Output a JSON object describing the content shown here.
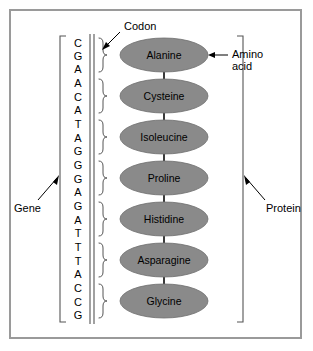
{
  "figure": {
    "background_color": "#ffffff",
    "frame_color": "#9a9a9a"
  },
  "dna": {
    "sequence": [
      "C",
      "G",
      "A",
      "A",
      "C",
      "A",
      "T",
      "A",
      "G",
      "G",
      "G",
      "A",
      "G",
      "A",
      "T",
      "T",
      "T",
      "A",
      "C",
      "C",
      "G"
    ],
    "sequence_string": "CGAACATAGGGAGATTTACCG",
    "base_count": 21,
    "strand_color": "#8a8a8a",
    "bracket_color": "#555555"
  },
  "codons": {
    "count": 7,
    "bases_per_codon": 3,
    "groups": [
      "CGA",
      "ACA",
      "TAG",
      "GGA",
      "GAT",
      "TTA",
      "CCG"
    ],
    "brace_color": "#555555"
  },
  "protein": {
    "amino_acids": [
      {
        "name": "Alanine"
      },
      {
        "name": "Cysteine"
      },
      {
        "name": "Isoleucine"
      },
      {
        "name": "Proline"
      },
      {
        "name": "Histidine"
      },
      {
        "name": "Asparagine"
      },
      {
        "name": "Glycine"
      }
    ],
    "ellipse_fill": "#8a8a8a",
    "ellipse_stroke": "#6e6e6e",
    "bond_color": "#3a3a3a",
    "label_color": "#000000"
  },
  "labels": {
    "codon": "Codon",
    "amino_acid_line1": "Amino",
    "amino_acid_line2": "acid",
    "gene": "Gene",
    "protein": "Protein"
  }
}
